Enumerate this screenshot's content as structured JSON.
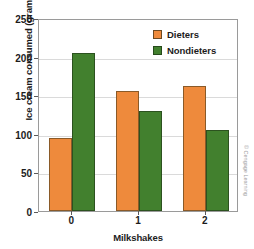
{
  "chart_data": {
    "type": "bar",
    "title": "",
    "subtitle": "",
    "xlabel": "Milkshakes",
    "ylabel": "Ice cream consumed (grams)",
    "categories": [
      "0",
      "1",
      "2"
    ],
    "series": [
      {
        "name": "Dieters",
        "color": "#ee8a3c",
        "values": [
          95,
          155,
          162
        ]
      },
      {
        "name": "Nondieters",
        "color": "#42802e",
        "values": [
          205,
          129,
          105
        ]
      }
    ],
    "ylim": [
      0,
      250
    ],
    "ytick_values": [
      0,
      50,
      100,
      150,
      200,
      250
    ],
    "ytick_labels": [
      "0",
      "50",
      "100",
      "150",
      "200",
      "250"
    ],
    "grid": "horizontal",
    "legend_position": "top-right-inside",
    "annotations": []
  },
  "attribution": {
    "text": "© Cengage Learning"
  }
}
